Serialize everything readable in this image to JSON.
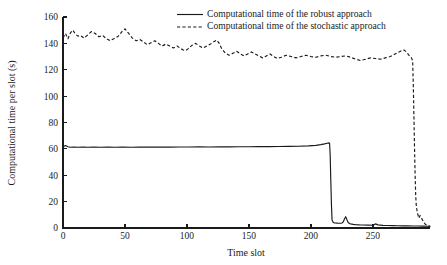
{
  "chart_data": {
    "type": "line",
    "title": "",
    "xlabel": "Time slot",
    "ylabel": "Computational time per slot (s)",
    "xlim": [
      0,
      296
    ],
    "ylim": [
      0,
      160
    ],
    "grid": false,
    "legend_position": "top-center",
    "xticks": [
      0,
      50,
      100,
      150,
      200,
      250
    ],
    "xtick_labels": [
      "0",
      "50",
      "100",
      "150",
      "200",
      "250"
    ],
    "yticks": [
      0,
      20,
      40,
      60,
      80,
      100,
      120,
      140,
      160
    ],
    "ytick_labels": [
      "0",
      "20",
      "40",
      "60",
      "80",
      "100",
      "120",
      "140",
      "160"
    ],
    "series": [
      {
        "name": "Computational time of the robust approach",
        "style": "solid",
        "color": "#1a1a1a",
        "x": [
          0,
          2,
          4,
          6,
          9,
          12,
          16,
          20,
          25,
          30,
          36,
          42,
          48,
          55,
          62,
          70,
          78,
          86,
          94,
          102,
          110,
          118,
          126,
          134,
          142,
          150,
          158,
          166,
          174,
          182,
          190,
          198,
          204,
          208,
          211,
          213,
          214,
          215,
          215.5,
          216,
          216.5,
          217,
          218,
          219,
          220,
          221,
          222,
          223,
          224,
          225,
          226,
          227,
          228,
          229,
          230,
          231,
          232,
          234,
          236,
          239,
          242,
          246,
          250,
          251,
          252,
          254,
          258,
          262,
          266,
          270,
          274,
          278,
          282,
          286,
          290,
          294,
          296
        ],
        "y": [
          61.5,
          62.5,
          61.6,
          61.2,
          61.3,
          61.2,
          61.3,
          61.2,
          61.3,
          61.2,
          61.3,
          61.2,
          61.3,
          61.2,
          61.3,
          61.3,
          61.4,
          61.3,
          61.4,
          61.4,
          61.5,
          61.4,
          61.5,
          61.5,
          61.6,
          61.6,
          61.7,
          61.7,
          61.8,
          61.9,
          62.0,
          62.3,
          62.7,
          63.2,
          63.8,
          64.3,
          64.5,
          64.4,
          55.0,
          36.0,
          18.0,
          6.0,
          4.2,
          3.9,
          3.8,
          3.7,
          3.6,
          3.6,
          3.6,
          3.8,
          4.6,
          6.8,
          8.6,
          6.2,
          4.2,
          3.4,
          3.1,
          2.8,
          2.6,
          2.4,
          2.3,
          2.2,
          2.1,
          2.6,
          3.1,
          2.4,
          2.0,
          1.9,
          1.8,
          1.7,
          1.6,
          1.6,
          1.5,
          1.5,
          1.4,
          1.3,
          1.2
        ]
      },
      {
        "name": "Computational time of the stochastic approach",
        "style": "dashed",
        "color": "#1a1a1a",
        "x": [
          0,
          2,
          4,
          6,
          8,
          10,
          12,
          14,
          17,
          20,
          23,
          26,
          29,
          32,
          35,
          38,
          41,
          44,
          46,
          48,
          50,
          53,
          56,
          59,
          62,
          65,
          68,
          71,
          74,
          77,
          80,
          83,
          86,
          89,
          92,
          95,
          97,
          99,
          101,
          104,
          107,
          110,
          113,
          116,
          119,
          122,
          124,
          126,
          128,
          131,
          134,
          137,
          140,
          143,
          146,
          149,
          152,
          155,
          158,
          161,
          164,
          167,
          170,
          173,
          176,
          180,
          184,
          188,
          192,
          196,
          200,
          204,
          208,
          212,
          216,
          220,
          224,
          228,
          232,
          236,
          240,
          244,
          248,
          252,
          256,
          260,
          264,
          267,
          270,
          273,
          275,
          277,
          279,
          281,
          282,
          282.5,
          283,
          283.5,
          284,
          284.5,
          285,
          286,
          287,
          288,
          290,
          292,
          294,
          296
        ],
        "y": [
          144.0,
          147.5,
          143.5,
          148.0,
          150.0,
          147.0,
          145.5,
          146.0,
          144.0,
          146.5,
          149.0,
          147.5,
          145.0,
          146.0,
          143.5,
          142.0,
          143.5,
          145.0,
          147.0,
          149.5,
          151.0,
          147.5,
          144.0,
          142.0,
          143.0,
          141.0,
          139.0,
          140.5,
          142.0,
          140.0,
          138.0,
          139.5,
          138.0,
          136.5,
          138.0,
          136.0,
          135.0,
          134.5,
          136.0,
          138.5,
          140.0,
          138.0,
          136.5,
          138.0,
          139.5,
          141.5,
          142.5,
          140.0,
          136.0,
          132.5,
          131.0,
          132.5,
          134.0,
          132.0,
          130.5,
          132.0,
          133.5,
          132.0,
          130.5,
          129.0,
          130.5,
          132.0,
          130.0,
          128.5,
          129.5,
          131.0,
          130.0,
          129.0,
          130.0,
          131.0,
          130.0,
          129.5,
          130.5,
          131.0,
          130.0,
          129.5,
          130.0,
          130.5,
          129.5,
          128.0,
          127.0,
          128.0,
          129.0,
          128.5,
          128.0,
          129.0,
          130.0,
          131.5,
          133.0,
          134.5,
          135.0,
          133.5,
          131.0,
          129.0,
          127.0,
          110.0,
          86.0,
          62.0,
          40.0,
          24.0,
          16.0,
          11.0,
          7.5,
          9.5,
          6.0,
          3.0,
          1.8,
          1.2
        ]
      }
    ],
    "legend": [
      {
        "label": "Computational time of the robust approach",
        "style": "solid"
      },
      {
        "label": "Computational time of the stochastic approach",
        "style": "dashed"
      }
    ]
  }
}
